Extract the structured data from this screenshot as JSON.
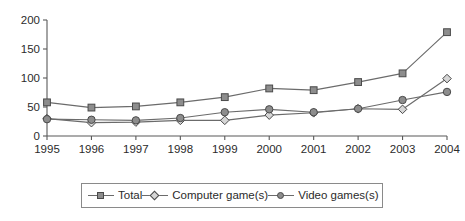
{
  "chart_data": {
    "type": "line",
    "title": "",
    "subtitle": "",
    "xlabel": "",
    "ylabel": "",
    "categories": [
      "1995",
      "1996",
      "1997",
      "1998",
      "1999",
      "2000",
      "2001",
      "2002",
      "2003",
      "2004"
    ],
    "series": [
      {
        "name": "Total",
        "marker": "square-filled",
        "values": [
          58,
          49,
          51,
          58,
          67,
          82,
          79,
          93,
          108,
          179
        ]
      },
      {
        "name": "Computer game(s)",
        "marker": "diamond-open",
        "values": [
          30,
          23,
          24,
          27,
          27,
          36,
          40,
          47,
          46,
          99
        ]
      },
      {
        "name": "Video games(s)",
        "marker": "circle-filled",
        "values": [
          29,
          28,
          27,
          31,
          41,
          46,
          41,
          47,
          62,
          76
        ]
      }
    ],
    "ylim": [
      0,
      200
    ],
    "yticks": [
      0,
      50,
      100,
      150,
      200
    ],
    "ytick_labels": [
      "0",
      "50",
      "100",
      "150",
      "200"
    ],
    "grid": false,
    "legend_position": "bottom",
    "colors": {
      "line": "#6b6b6b",
      "marker_fill": "#8d8d8d",
      "marker_open": "#d6d6d6",
      "marker_stroke": "#4a4a4a",
      "axis": "#595959",
      "text": "#2b2b2b",
      "background": "#ffffff"
    }
  },
  "legend": {
    "items": [
      {
        "label": "Total"
      },
      {
        "label": "Computer game(s)"
      },
      {
        "label": "Video games(s)"
      }
    ]
  }
}
